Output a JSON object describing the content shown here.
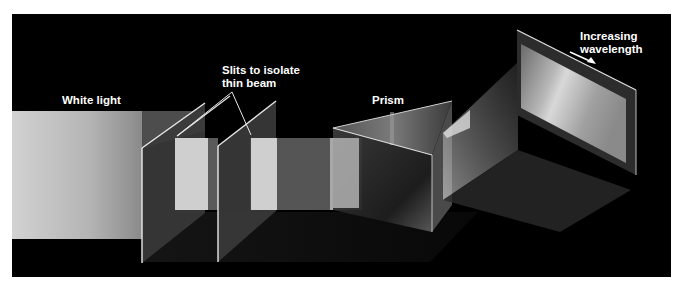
{
  "diagram": {
    "labels": {
      "white_light": "White light",
      "slits": "Slits to isolate\nthin beam",
      "prism": "Prism",
      "wavelength": "Increasing\nwavelength"
    },
    "components": [
      {
        "id": "white-light-beam",
        "description": "broad beam of white light"
      },
      {
        "id": "slit-1",
        "description": "first slit panel"
      },
      {
        "id": "slit-2",
        "description": "second slit panel"
      },
      {
        "id": "thin-beam",
        "description": "narrow beam after slits"
      },
      {
        "id": "prism",
        "description": "triangular glass prism"
      },
      {
        "id": "spectrum-screen",
        "description": "screen showing dispersed spectrum"
      },
      {
        "id": "wavelength-arrow",
        "description": "arrow indicating increasing wavelength direction"
      }
    ],
    "colors": {
      "page_background": "#ffffff",
      "panel_background": "#000000",
      "light": "#c8c8c8",
      "slit_panel": "#3a3a3a",
      "edge": "#e8e8e8",
      "label_text": "#ffffff"
    }
  }
}
